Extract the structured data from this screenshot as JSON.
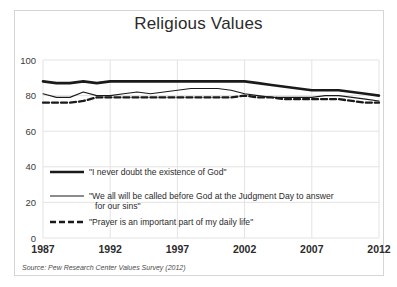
{
  "frame": {
    "border_color": "#d5d5d5",
    "background": "#ffffff"
  },
  "chart_data": {
    "type": "line",
    "title": "Religious Values",
    "xlabel": "",
    "ylabel": "",
    "ylim": [
      0,
      100
    ],
    "xlim": [
      1987,
      2012
    ],
    "yticks": [
      "0",
      "20",
      "40",
      "60",
      "80",
      "100"
    ],
    "ytick_values": [
      0,
      20,
      40,
      60,
      80,
      100
    ],
    "xticks": [
      "1987",
      "1992",
      "1997",
      "2002",
      "2007",
      "2012"
    ],
    "xtick_values": [
      1987,
      1992,
      1997,
      2002,
      2007,
      2012
    ],
    "grid": true,
    "grid_color": "#e3e3e3",
    "legend_position": "inside-lower-left",
    "line_color": "#1a1a1a",
    "x": [
      1987,
      1988,
      1989,
      1990,
      1991,
      1992,
      1993,
      1994,
      1995,
      1996,
      1997,
      1998,
      1999,
      2000,
      2001,
      2002,
      2003,
      2004,
      2005,
      2006,
      2007,
      2008,
      2009,
      2010,
      2011,
      2012
    ],
    "series": [
      {
        "name": "\"I never doubt the existence of God\"",
        "style": "thick-solid",
        "stroke_width": 2.6,
        "dash": "none",
        "values": [
          88,
          87,
          87,
          88,
          87,
          88,
          88,
          88,
          88,
          88,
          88,
          88,
          88,
          88,
          88,
          88,
          87,
          86,
          85,
          84,
          83,
          83,
          83,
          82,
          81,
          80
        ]
      },
      {
        "name": "\"We all will be called before God at the Judgment Day to answer for our sins\"",
        "style": "thin-solid",
        "stroke_width": 1.1,
        "dash": "none",
        "values": [
          81,
          79,
          79,
          82,
          80,
          80,
          81,
          82,
          81,
          82,
          83,
          84,
          84,
          84,
          83,
          81,
          80,
          79,
          79,
          79,
          79,
          80,
          80,
          79,
          78,
          77
        ]
      },
      {
        "name": "\"Prayer is an important part of my daily life\"",
        "style": "dashed",
        "stroke_width": 2.3,
        "dash": "6,3",
        "values": [
          76,
          76,
          76,
          77,
          79,
          79,
          79,
          79,
          79,
          79,
          79,
          79,
          79,
          79,
          79,
          80,
          79,
          79,
          78,
          78,
          78,
          78,
          78,
          77,
          76,
          76
        ]
      }
    ],
    "source": "Source: Pew Research Center Values Survey (2012)"
  },
  "legend": {
    "items": [
      {
        "label": "\"I never doubt the existence of God\"",
        "style": "thick-solid"
      },
      {
        "label": "\"We all will be called before God at the Judgment Day to answer",
        "label2": "for our sins\"",
        "style": "thin-solid"
      },
      {
        "label": "\"Prayer is an important part of my daily life\"",
        "style": "dashed"
      }
    ]
  }
}
